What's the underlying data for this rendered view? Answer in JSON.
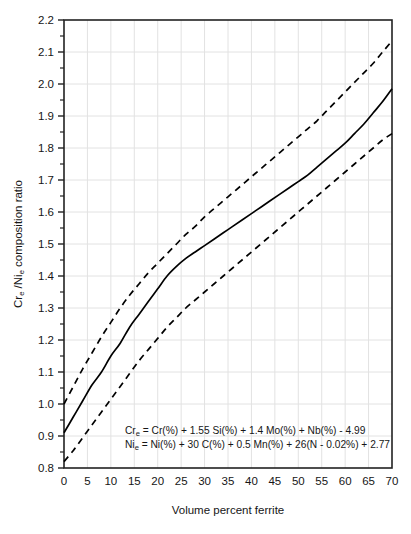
{
  "chart_data": {
    "type": "line",
    "title": "",
    "xlabel": "Volume percent ferrite",
    "ylabel": "Cre /Nie composition ratio",
    "ylabel_parts": {
      "pre": "Cr",
      "sub1": "e",
      "mid": " /Ni",
      "sub2": "e",
      "post": " composition ratio"
    },
    "xlim": [
      0,
      70
    ],
    "ylim": [
      0.8,
      2.2
    ],
    "xticks": [
      0,
      5,
      10,
      15,
      20,
      25,
      30,
      35,
      40,
      45,
      50,
      55,
      60,
      65,
      70
    ],
    "xtick_labels": [
      "0",
      "5",
      "10",
      "15",
      "20",
      "25",
      "30",
      "35",
      "40",
      "45",
      "50",
      "55",
      "60",
      "65",
      "70"
    ],
    "yticks": [
      0.8,
      0.9,
      1.0,
      1.1,
      1.2,
      1.3,
      1.4,
      1.5,
      1.6,
      1.7,
      1.8,
      1.9,
      2.0,
      2.1,
      2.2
    ],
    "ytick_labels": [
      "0.8",
      "0.9",
      "1.0",
      "1.1",
      "1.2",
      "1.3",
      "1.4",
      "1.5",
      "1.6",
      "1.7",
      "1.8",
      "1.9",
      "2.0",
      "2.1",
      "2.2"
    ],
    "minor_yticks": [
      0.85,
      0.95,
      1.05,
      1.15,
      1.25,
      1.35,
      1.45,
      1.55,
      1.65,
      1.75,
      1.85,
      1.95,
      2.05,
      2.15
    ],
    "grid": true,
    "grid_color": "#e2e2e2",
    "legend": "none",
    "line_color": "#000000",
    "series": [
      {
        "name": "mean",
        "style": "solid",
        "x": [
          0,
          2,
          4,
          6,
          8,
          10,
          12,
          14,
          16,
          18,
          20,
          22,
          24,
          26,
          28,
          30,
          32,
          34,
          36,
          38,
          40,
          42,
          44,
          46,
          48,
          50,
          52,
          54,
          56,
          58,
          60,
          62,
          64,
          66,
          68,
          70
        ],
        "y": [
          0.91,
          0.96,
          1.01,
          1.06,
          1.1,
          1.15,
          1.19,
          1.24,
          1.28,
          1.32,
          1.36,
          1.4,
          1.43,
          1.455,
          1.475,
          1.495,
          1.515,
          1.535,
          1.555,
          1.575,
          1.595,
          1.615,
          1.635,
          1.655,
          1.675,
          1.695,
          1.715,
          1.74,
          1.765,
          1.79,
          1.815,
          1.845,
          1.875,
          1.91,
          1.945,
          1.985
        ]
      },
      {
        "name": "upper-bound",
        "style": "dashed",
        "x": [
          0,
          2,
          4,
          6,
          8,
          10,
          12,
          14,
          16,
          18,
          20,
          22,
          24,
          26,
          28,
          30,
          32,
          34,
          36,
          38,
          40,
          42,
          44,
          46,
          48,
          50,
          52,
          54,
          56,
          58,
          60,
          62,
          64,
          66,
          68,
          70
        ],
        "y": [
          1.0,
          1.055,
          1.11,
          1.16,
          1.21,
          1.255,
          1.3,
          1.34,
          1.375,
          1.41,
          1.44,
          1.47,
          1.5,
          1.53,
          1.555,
          1.585,
          1.61,
          1.635,
          1.66,
          1.685,
          1.71,
          1.735,
          1.76,
          1.785,
          1.81,
          1.835,
          1.86,
          1.885,
          1.915,
          1.945,
          1.975,
          2.005,
          2.035,
          2.065,
          2.1,
          2.135
        ]
      },
      {
        "name": "lower-bound",
        "style": "dashed",
        "x": [
          0,
          2,
          4,
          6,
          8,
          10,
          12,
          14,
          16,
          18,
          20,
          22,
          24,
          26,
          28,
          30,
          32,
          34,
          36,
          38,
          40,
          42,
          44,
          46,
          48,
          50,
          52,
          54,
          56,
          58,
          60,
          62,
          64,
          66,
          68,
          70
        ],
        "y": [
          0.82,
          0.855,
          0.895,
          0.935,
          0.975,
          1.015,
          1.055,
          1.095,
          1.135,
          1.17,
          1.205,
          1.24,
          1.27,
          1.3,
          1.325,
          1.35,
          1.375,
          1.4,
          1.425,
          1.45,
          1.475,
          1.5,
          1.525,
          1.55,
          1.575,
          1.6,
          1.625,
          1.65,
          1.675,
          1.7,
          1.725,
          1.75,
          1.775,
          1.8,
          1.825,
          1.845
        ]
      }
    ],
    "annotations": [
      {
        "name": "chromium-equivalent-formula",
        "line_index": 0,
        "symbol": "Cr",
        "symbol_sub": "e",
        "body": " = Cr(%) + 1.55 Si(%) + 1.4 Mo(%) + Nb(%) - 4.99"
      },
      {
        "name": "nickel-equivalent-formula",
        "line_index": 1,
        "symbol": "Ni",
        "symbol_sub": "e",
        "body": " = Ni(%) + 30 C(%) + 0.5 Mn(%) + 26(N - 0.02%) + 2.77"
      }
    ]
  }
}
